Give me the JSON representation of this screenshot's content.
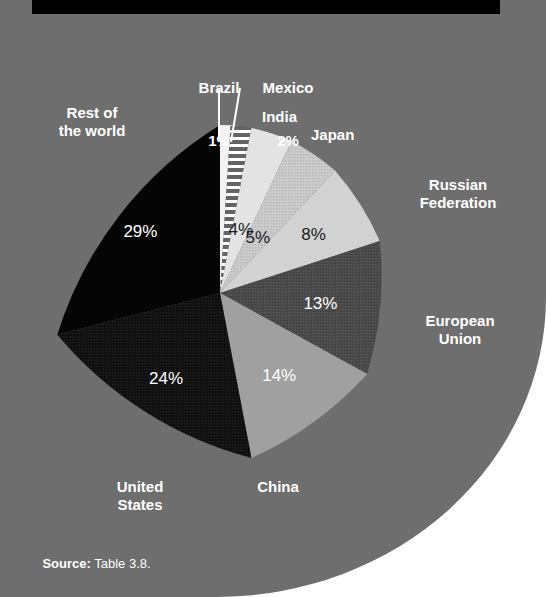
{
  "banner": {
    "title": "Carbon dioxide emissions in 1995"
  },
  "source": {
    "prefix": "Source:",
    "text": " Table 3.8."
  },
  "colors": {
    "panel_background": "#6e6e6e",
    "page_background": "#ffffff",
    "banner_background": "#000000",
    "label_text": "#ffffff",
    "dark_label_text": "#1a1a1a"
  },
  "callouts": [
    {
      "name": "brazil",
      "label": "Brazil",
      "value": "1%"
    },
    {
      "name": "mexico",
      "label": "Mexico",
      "value": "2%"
    }
  ],
  "outside_labels": [
    {
      "name": "rest-of-the-world",
      "label": "Rest of\nthe world"
    },
    {
      "name": "india",
      "label": "India"
    },
    {
      "name": "japan",
      "label": "Japan"
    },
    {
      "name": "russian-federation",
      "label": "Russian\nFederation"
    },
    {
      "name": "european-union",
      "label": "European\nUnion"
    },
    {
      "name": "china",
      "label": "China"
    },
    {
      "name": "united-states",
      "label": "United\nStates"
    }
  ],
  "chart_data": {
    "type": "pie",
    "title": "Carbon dioxide emissions in 1995",
    "subtitle": "",
    "xlabel": "",
    "ylabel": "",
    "units": "percent of world total",
    "legend": "none (direct labels)",
    "grid": false,
    "total": 100,
    "categories": [
      "Brazil",
      "Mexico",
      "India",
      "Japan",
      "Russian Federation",
      "European Union",
      "China",
      "United States",
      "Rest of the world"
    ],
    "values": [
      1,
      2,
      4,
      5,
      8,
      13,
      14,
      24,
      29
    ],
    "labels": [
      "1%",
      "2%",
      "4%",
      "5%",
      "8%",
      "13%",
      "14%",
      "24%",
      "29%"
    ],
    "slices": [
      {
        "name": "brazil",
        "label": "Brazil",
        "value": 1,
        "display": "1%",
        "fill": "#f2f2f2",
        "pattern": "none",
        "text_color": "#1a1a1a",
        "label_placement": "callout-above"
      },
      {
        "name": "mexico",
        "label": "Mexico",
        "value": 2,
        "display": "2%",
        "fill": "#dcdcdc",
        "pattern": "horizontal-stripes",
        "text_color": "#1a1a1a",
        "label_placement": "callout-above"
      },
      {
        "name": "india",
        "label": "India",
        "value": 4,
        "display": "4%",
        "fill": "#e3e3e3",
        "pattern": "none",
        "text_color": "#1a1a1a",
        "label_placement": "inside"
      },
      {
        "name": "japan",
        "label": "Japan",
        "value": 5,
        "display": "5%",
        "fill": "#c8c8c8",
        "pattern": "stipple",
        "text_color": "#1a1a1a",
        "label_placement": "inside"
      },
      {
        "name": "russian-federation",
        "label": "Russian Federation",
        "value": 8,
        "display": "8%",
        "fill": "#d2d2d2",
        "pattern": "none",
        "text_color": "#1a1a1a",
        "label_placement": "inside"
      },
      {
        "name": "european-union",
        "label": "European Union",
        "value": 13,
        "display": "13%",
        "fill": "#4a4a4a",
        "pattern": "stipple",
        "text_color": "#ffffff",
        "label_placement": "inside"
      },
      {
        "name": "china",
        "label": "China",
        "value": 14,
        "display": "14%",
        "fill": "#a0a0a0",
        "pattern": "none",
        "text_color": "#ffffff",
        "label_placement": "inside"
      },
      {
        "name": "united-states",
        "label": "United States",
        "value": 24,
        "display": "24%",
        "fill": "#121212",
        "pattern": "stipple",
        "text_color": "#ffffff",
        "label_placement": "inside"
      },
      {
        "name": "rest-of-the-world",
        "label": "Rest of the world",
        "value": 29,
        "display": "29%",
        "fill": "#050505",
        "pattern": "none",
        "text_color": "#ffffff",
        "label_placement": "inside"
      }
    ]
  }
}
